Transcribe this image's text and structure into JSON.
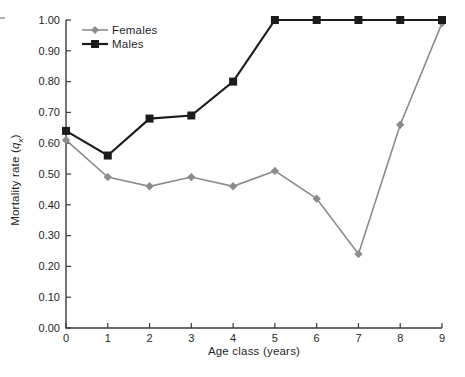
{
  "figure": {
    "background": "#ffffff",
    "text_color": "#1f1f1f",
    "axis_color": "#3c3c3c"
  },
  "chart_data": {
    "type": "line",
    "title": "",
    "xlabel": "Age class (years)",
    "ylabel": {
      "prefix": "Mortality rate (",
      "symbol": "q",
      "subscript": "x",
      "suffix": ")"
    },
    "x": [
      0,
      1,
      2,
      3,
      4,
      5,
      6,
      7,
      8,
      9
    ],
    "xlim": [
      0,
      9
    ],
    "ylim": [
      0.0,
      1.0
    ],
    "x_tick_labels": [
      "0",
      "1",
      "2",
      "3",
      "4",
      "5",
      "6",
      "7",
      "8",
      "9"
    ],
    "y_tick_labels": [
      "0.00",
      "0.10",
      "0.20",
      "0.30",
      "0.40",
      "0.50",
      "0.60",
      "0.70",
      "0.80",
      "0.90",
      "1.00"
    ],
    "grid": false,
    "legend_position": "top-left",
    "series": [
      {
        "name": "Females",
        "marker": "diamond",
        "color": "#8c8c8c",
        "line_width": 1.6,
        "values": [
          0.61,
          0.49,
          0.46,
          0.49,
          0.46,
          0.51,
          0.42,
          0.24,
          0.66,
          0.99
        ]
      },
      {
        "name": "Males",
        "marker": "square",
        "color": "#1c1c1c",
        "line_width": 2.2,
        "values": [
          0.64,
          0.56,
          0.68,
          0.69,
          0.8,
          1.0,
          1.0,
          1.0,
          1.0,
          1.0
        ]
      }
    ]
  }
}
